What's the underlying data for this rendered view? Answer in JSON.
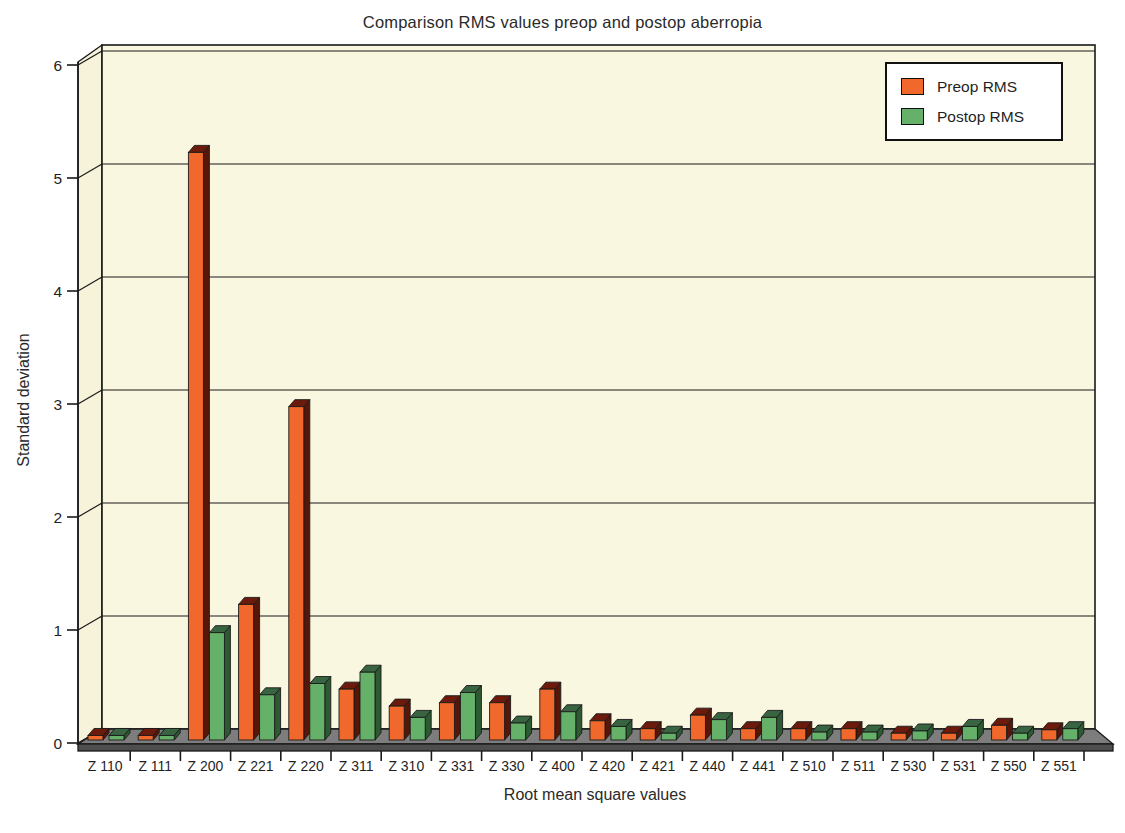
{
  "chart_data": {
    "type": "bar",
    "style": "3d-bar",
    "title": "Comparison RMS values preop and postop aberropia",
    "xlabel": "Root mean square values",
    "ylabel": "Standard deviation",
    "ylim": [
      0,
      6
    ],
    "yticks": [
      0,
      1,
      2,
      3,
      4,
      5,
      6
    ],
    "grid": "horizontal",
    "legend_position": "top-right",
    "categories": [
      "Z 110",
      "Z 111",
      "Z 200",
      "Z 221",
      "Z 220",
      "Z 311",
      "Z 310",
      "Z 331",
      "Z 330",
      "Z 400",
      "Z 420",
      "Z 421",
      "Z 440",
      "Z 441",
      "Z 510",
      "Z 511",
      "Z 530",
      "Z 531",
      "Z 550",
      "Z 551"
    ],
    "series": [
      {
        "name": "Preop RMS",
        "color": "#F0682C",
        "color_dark_side": "#571708",
        "color_dark_top": "#6B1A0B",
        "values": [
          0.04,
          0.04,
          5.2,
          1.2,
          2.95,
          0.45,
          0.3,
          0.33,
          0.33,
          0.45,
          0.17,
          0.1,
          0.22,
          0.1,
          0.1,
          0.1,
          0.06,
          0.06,
          0.13,
          0.09
        ]
      },
      {
        "name": "Postop RMS",
        "color": "#66B169",
        "color_dark_side": "#2E5A33",
        "color_dark_top": "#386441",
        "values": [
          0.04,
          0.04,
          0.95,
          0.4,
          0.5,
          0.6,
          0.2,
          0.42,
          0.15,
          0.25,
          0.12,
          0.06,
          0.18,
          0.2,
          0.07,
          0.07,
          0.08,
          0.12,
          0.06,
          0.1
        ]
      }
    ],
    "colors": {
      "background": "#FFFFFF",
      "plot_background": "#FAF7E0",
      "wall": "#F6F3DA",
      "floor_top": "#7D7D7D",
      "floor_front": "#4E4E4E",
      "line": "#1A1A1A",
      "text": "#1F1F1F"
    }
  }
}
